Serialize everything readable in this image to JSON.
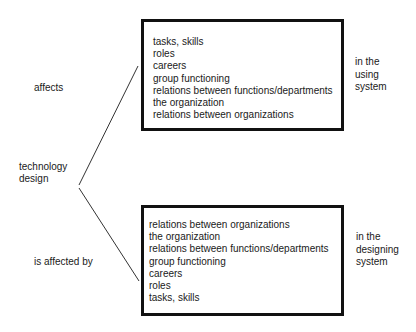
{
  "labels": {
    "affects": "affects",
    "technology_design": [
      "technology",
      "design"
    ],
    "is_affected_by": "is affected by"
  },
  "top_box": {
    "items": [
      "tasks, skills",
      "roles",
      "careers",
      "group functioning",
      "relations between functions/departments",
      "the organization",
      "relations between organizations"
    ],
    "side_label": [
      "in the",
      "using",
      "system"
    ]
  },
  "bottom_box": {
    "items": [
      "relations between organizations",
      "the organization",
      "relations between functions/departments",
      "group functioning",
      "careers",
      "roles",
      "tasks, skills"
    ],
    "side_label": [
      "in the",
      "designing",
      "system"
    ]
  },
  "colors": {
    "line": "#333333",
    "box_border": "#111111",
    "text": "#1a1a1a"
  }
}
